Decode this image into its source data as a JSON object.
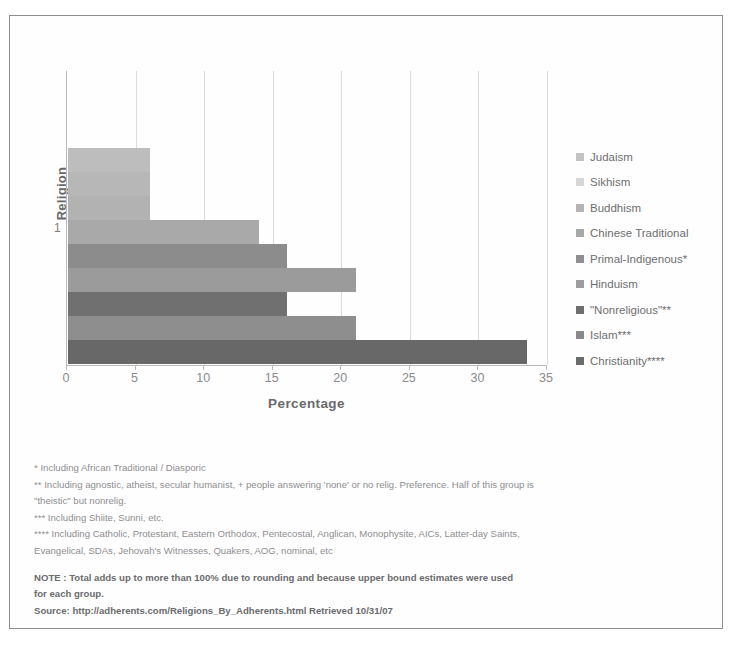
{
  "chart_data": {
    "type": "bar",
    "orientation": "horizontal",
    "title": "",
    "xlabel": "Percentage",
    "ylabel": "Religion",
    "xlim": [
      0,
      35
    ],
    "xticks": [
      0,
      5,
      10,
      15,
      20,
      25,
      30,
      35
    ],
    "yticks": [
      "1"
    ],
    "grid": "vertical",
    "legend_position": "right",
    "categories": [
      "1"
    ],
    "series": [
      {
        "name": "Judaism",
        "values": [
          0.2
        ],
        "color": "#c2c2c2"
      },
      {
        "name": "Sikhism",
        "values": [
          0.4
        ],
        "color": "#d5d5d5"
      },
      {
        "name": "Buddhism",
        "values": [
          6.0
        ],
        "color": "#b4b4b4"
      },
      {
        "name": "Chinese Traditional",
        "values": [
          13.9
        ],
        "color": "#a8a8a8"
      },
      {
        "name": "Primal-Indigenous*",
        "values": [
          16.0
        ],
        "color": "#8f8f8f"
      },
      {
        "name": "Hinduism",
        "values": [
          21.0
        ],
        "color": "#9d9d9d"
      },
      {
        "name": "\"Nonreligious\"**",
        "values": [
          16.0
        ],
        "color": "#6f6f6f"
      },
      {
        "name": "Islam***",
        "values": [
          21.0
        ],
        "color": "#8a8a8a"
      },
      {
        "name": "Christianity****",
        "values": [
          33.5
        ],
        "color": "#6b6b6b"
      }
    ],
    "bar_segments": [
      {
        "label": "Judaism",
        "end": 6.0,
        "color": "#bdbdbd"
      },
      {
        "label": "Sikhism",
        "end": 6.0,
        "color": "#b7b7b7"
      },
      {
        "label": "Buddhism",
        "end": 6.0,
        "color": "#b2b2b2"
      },
      {
        "label": "Chinese Traditional",
        "end": 13.9,
        "color": "#a9a9a9"
      },
      {
        "label": "Primal-Indigenous*",
        "end": 16.0,
        "color": "#8c8c8c"
      },
      {
        "label": "Hinduism",
        "end": 21.0,
        "color": "#9b9b9b"
      },
      {
        "label": "\"Nonreligious\"**",
        "end": 16.0,
        "color": "#707070"
      },
      {
        "label": "Islam***",
        "end": 21.0,
        "color": "#8e8e8e"
      },
      {
        "label": "Christianity****",
        "end": 33.5,
        "color": "#686868"
      }
    ]
  },
  "axes": {
    "y_title": "Religion",
    "y_tick_label": "1",
    "x_title": "Percentage",
    "x_tick_labels": [
      "0",
      "5",
      "10",
      "15",
      "20",
      "25",
      "30",
      "35"
    ]
  },
  "legend": {
    "items": [
      {
        "label": "Judaism",
        "color": "#c2c2c2"
      },
      {
        "label": "Sikhism",
        "color": "#d6d6d6"
      },
      {
        "label": "Buddhism",
        "color": "#b4b4b4"
      },
      {
        "label": "Chinese Traditional",
        "color": "#a8a8a8"
      },
      {
        "label": "Primal-Indigenous*",
        "color": "#8f8f8f"
      },
      {
        "label": "Hinduism",
        "color": "#9d9d9d"
      },
      {
        "label": "\"Nonreligious\"**",
        "color": "#6f6f6f"
      },
      {
        "label": "Islam***",
        "color": "#8a8a8a"
      },
      {
        "label": "Christianity****",
        "color": "#6b6b6b"
      }
    ]
  },
  "footnotes": {
    "line1": "* Including African Traditional / Diasporic",
    "line2a": "** Including agnostic, atheist, secular humanist, + people answering 'none' or no relig. Preference. Half of this group is",
    "line2b": "\"theistic\" but nonrelig.",
    "line3": "*** Including Shiite, Sunni, etc.",
    "line4a": "**** Including Catholic, Protestant, Eastern Orthodox, Pentecostal, Anglican, Monophysite, AICs, Latter-day Saints,",
    "line4b": "Evangelical, SDAs, Jehovah's Witnesses, Quakers, AOG, nominal, etc",
    "note_a": "NOTE : Total adds up to more than 100% due to rounding and because upper bound estimates were used",
    "note_b": "for each group.",
    "source": "Source: http://adherents.com/Religions_By_Adherents.html Retrieved 10/31/07"
  }
}
